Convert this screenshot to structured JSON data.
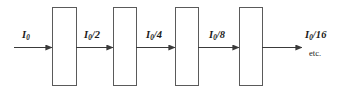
{
  "figure": {
    "background_color": "#ffffff",
    "stroke_color": "#3a3a3a",
    "box_stroke_color": "#5a5a5a",
    "text_color": "#1a1a1a",
    "boxes": [
      {
        "name": "polarizer-1",
        "x": 52,
        "y": 7,
        "width": 24,
        "height": 78
      },
      {
        "name": "polarizer-2",
        "x": 113,
        "y": 7,
        "width": 23,
        "height": 78
      },
      {
        "name": "polarizer-3",
        "x": 175,
        "y": 7,
        "width": 23,
        "height": 78
      },
      {
        "name": "polarizer-4",
        "x": 239,
        "y": 7,
        "width": 23,
        "height": 78
      }
    ],
    "beam_y": 47,
    "arrows": [
      {
        "name": "beam-arrow-0",
        "x1": 14,
        "x2": 52
      },
      {
        "name": "beam-arrow-1",
        "x1": 76,
        "x2": 113
      },
      {
        "name": "beam-arrow-2",
        "x1": 136,
        "x2": 175
      },
      {
        "name": "beam-arrow-3",
        "x1": 198,
        "x2": 239
      },
      {
        "name": "beam-arrow-4",
        "x1": 262,
        "x2": 302
      }
    ],
    "labels": [
      {
        "name": "label-i0",
        "symbol": "I",
        "subscript": "0",
        "divisor": "",
        "x": 22,
        "y": 30
      },
      {
        "name": "label-i0-2",
        "symbol": "I",
        "subscript": "0",
        "divisor": "/2",
        "x": 84,
        "y": 30
      },
      {
        "name": "label-i0-4",
        "symbol": "I",
        "subscript": "0",
        "divisor": "/4",
        "x": 146,
        "y": 30
      },
      {
        "name": "label-i0-8",
        "symbol": "I",
        "subscript": "0",
        "divisor": "/8",
        "x": 209,
        "y": 30
      },
      {
        "name": "label-i0-16",
        "symbol": "I",
        "subscript": "0",
        "divisor": "/16",
        "x": 305,
        "y": 30
      }
    ],
    "etc_text": "etc.",
    "etc_x": 309,
    "etc_y": 49
  }
}
